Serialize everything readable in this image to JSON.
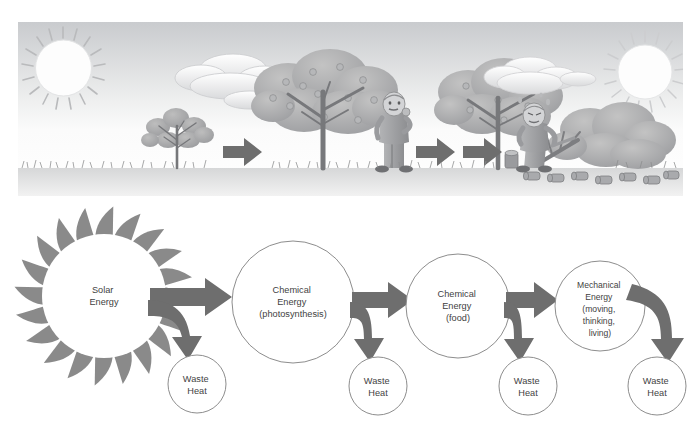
{
  "illustration": {
    "name": "energy-flow-illustration-strip",
    "panels": [
      {
        "name": "panel-sapling",
        "caption": "",
        "elements": [
          "sun-icon",
          "cloud-icon",
          "small-tree",
          "grass-ground"
        ]
      },
      {
        "name": "panel-mature-tree",
        "caption": "",
        "elements": [
          "fruit-tree",
          "grass-ground"
        ]
      },
      {
        "name": "panel-person-eating",
        "caption": "",
        "elements": [
          "man-eating-fruit",
          "fruit-tree",
          "grass-ground"
        ]
      },
      {
        "name": "panel-person-cutting",
        "caption": "",
        "elements": [
          "man-sawing-tree",
          "felled-tree",
          "logs",
          "sun-icon",
          "cloud-icon",
          "grass-ground"
        ]
      }
    ],
    "arrow_count": 3
  },
  "diagram": {
    "type": "flow",
    "nodes": [
      {
        "id": "solar",
        "shape": "sun",
        "lines": [
          "Solar",
          "Energy"
        ],
        "cx": 104,
        "cy": 100,
        "r": 62
      },
      {
        "id": "chem-photo",
        "shape": "circle",
        "lines": [
          "Chemical",
          "Energy",
          "(photosynthesis)"
        ],
        "cx": 293,
        "cy": 106,
        "r": 61
      },
      {
        "id": "chem-food",
        "shape": "circle",
        "lines": [
          "Chemical",
          "Energy",
          "(food)"
        ],
        "cx": 458,
        "cy": 110,
        "r": 52
      },
      {
        "id": "mechanical",
        "shape": "circle",
        "lines": [
          "Mechanical",
          "Energy",
          "(moving,",
          "thinking,",
          "living)"
        ],
        "cx": 600,
        "cy": 110,
        "r": 45
      }
    ],
    "waste_nodes": [
      {
        "id": "waste-1",
        "lines": [
          "Waste",
          "Heat"
        ],
        "cx": 197,
        "cy": 188,
        "r": 29
      },
      {
        "id": "waste-2",
        "lines": [
          "Waste",
          "Heat"
        ],
        "cx": 378,
        "cy": 190,
        "r": 29
      },
      {
        "id": "waste-3",
        "lines": [
          "Waste",
          "Heat"
        ],
        "cx": 528,
        "cy": 190,
        "r": 29
      },
      {
        "id": "waste-4",
        "lines": [
          "Waste",
          "Heat"
        ],
        "cx": 657,
        "cy": 190,
        "r": 29
      }
    ],
    "colors": {
      "arrow": "#6e6e6e",
      "sun": "#8a8a8a",
      "circle_stroke": "#8d8d8d",
      "text": "#3f3f3f",
      "background": "#ffffff"
    }
  }
}
